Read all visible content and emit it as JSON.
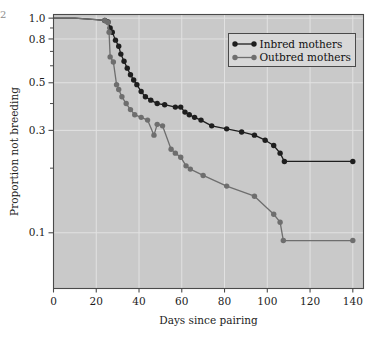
{
  "figure": {
    "corner_mark": "2",
    "background": "#ffffff",
    "panel_background": "#c9c9c9",
    "grid_color": "#e2e2e2",
    "axis_color": "#4a4a4a"
  },
  "chart_data": {
    "type": "line",
    "title": "",
    "subtitle": "",
    "xlabel": "Days since pairing",
    "ylabel": "Proportion not breeding",
    "xlim": [
      0,
      145
    ],
    "ylim": [
      0.055,
      1.04
    ],
    "yscale": "log",
    "xticks": [
      0,
      20,
      40,
      60,
      80,
      100,
      120,
      140
    ],
    "xticklabels": [
      "0",
      "20",
      "40",
      "60",
      "80",
      "100",
      "120",
      "140"
    ],
    "yticks": [
      1.0,
      0.8,
      0.5,
      0.3,
      0.1
    ],
    "yticklabels": [
      "1.0",
      "0.8",
      "0.5",
      "0.3",
      "0.1"
    ],
    "yminorticks": [
      0.9,
      0.7,
      0.6,
      0.4,
      0.2
    ],
    "grid": true,
    "grid_axis": "both",
    "legend_position": "upper right",
    "series": [
      {
        "name": "Inbred mothers",
        "color": "#1e1e1e",
        "marker": "circle",
        "points": [
          [
            0,
            1.0
          ],
          [
            10,
            1.0
          ],
          [
            20,
            0.985
          ],
          [
            24,
            0.975
          ],
          [
            25.5,
            0.96
          ],
          [
            26.5,
            0.9
          ],
          [
            27.5,
            0.86
          ],
          [
            29,
            0.79
          ],
          [
            30.5,
            0.74
          ],
          [
            31.5,
            0.68
          ],
          [
            33,
            0.63
          ],
          [
            34.5,
            0.585
          ],
          [
            36,
            0.545
          ],
          [
            37.5,
            0.515
          ],
          [
            39,
            0.49
          ],
          [
            41,
            0.455
          ],
          [
            43,
            0.43
          ],
          [
            45.5,
            0.415
          ],
          [
            48.5,
            0.4
          ],
          [
            52,
            0.395
          ],
          [
            57,
            0.385
          ],
          [
            59.5,
            0.385
          ],
          [
            61.5,
            0.365
          ],
          [
            63.5,
            0.355
          ],
          [
            66,
            0.345
          ],
          [
            69,
            0.335
          ],
          [
            74,
            0.315
          ],
          [
            81,
            0.305
          ],
          [
            88,
            0.295
          ],
          [
            94,
            0.285
          ],
          [
            99,
            0.27
          ],
          [
            103,
            0.255
          ],
          [
            106,
            0.235
          ],
          [
            108,
            0.215
          ],
          [
            140,
            0.215
          ]
        ]
      },
      {
        "name": "Outbred mothers",
        "color": "#6e6e6e",
        "marker": "circle",
        "points": [
          [
            0,
            1.0
          ],
          [
            10,
            1.0
          ],
          [
            20,
            0.985
          ],
          [
            24,
            0.975
          ],
          [
            25.5,
            0.955
          ],
          [
            26,
            0.86
          ],
          [
            26.5,
            0.66
          ],
          [
            28,
            0.625
          ],
          [
            29.5,
            0.49
          ],
          [
            30.5,
            0.465
          ],
          [
            32,
            0.43
          ],
          [
            34,
            0.4
          ],
          [
            36,
            0.375
          ],
          [
            38,
            0.355
          ],
          [
            41,
            0.345
          ],
          [
            44,
            0.335
          ],
          [
            47,
            0.285
          ],
          [
            48.5,
            0.32
          ],
          [
            51,
            0.315
          ],
          [
            55,
            0.245
          ],
          [
            57,
            0.235
          ],
          [
            59.5,
            0.225
          ],
          [
            62,
            0.205
          ],
          [
            64,
            0.198
          ],
          [
            70,
            0.185
          ],
          [
            81,
            0.165
          ],
          [
            94,
            0.148
          ],
          [
            103,
            0.122
          ],
          [
            106,
            0.112
          ],
          [
            107.5,
            0.092
          ],
          [
            140,
            0.092
          ]
        ]
      }
    ]
  },
  "legend": {
    "items": [
      {
        "label": "Inbred mothers",
        "color": "#1e1e1e"
      },
      {
        "label": "Outbred mothers",
        "color": "#6e6e6e"
      }
    ]
  }
}
